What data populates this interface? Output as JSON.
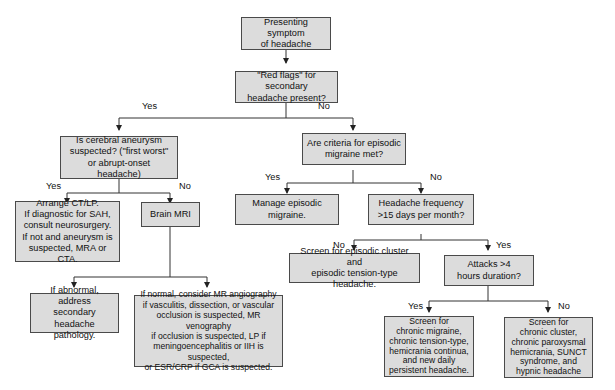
{
  "diagram": {
    "type": "flowchart",
    "colors": {
      "box_fill": "#dcdcdc",
      "box_border": "#4a4a4a",
      "line": "#333333",
      "background": "#ffffff"
    },
    "nodes": {
      "start": "Presenting symptom\nof headache",
      "red_flags": "\"Red flags\" for secondary\nheadache present?",
      "aneurysm": "Is cerebral aneurysm\nsuspected? (\"first worst\"\nor abrupt-onset headache)",
      "episodic_criteria": "Are criteria for episodic\nmigraine met?",
      "ct_lp": "Arrange CT/LP.\nIf diagnostic for SAH,\nconsult neurosurgery.\nIf not and aneurysm is\nsuspected, MRA or CTA.",
      "brain_mri": "Brain MRI",
      "manage_episodic": "Manage episodic\nmigraine.",
      "frequency": "Headache frequency\n>15 days per month?",
      "abnormal": "If abnormal, address\nsecondary headache\npathology.",
      "normal": "If normal, consider MR angiography\nif vasculitis, dissection, or vascular\nocclusion is suspected, MR venography\nif occlusion is suspected, LP if\nmeningoencephalitis or IIH is suspected,\nor ESR/CRP if GCA is suspected.",
      "screen_episodic": "Screen for episodic cluster and\nepisodic tension-type headache.",
      "attacks": "Attacks >4\nhours duration?",
      "screen_chronic_migraine": "Screen for\nchronic migraine,\nchronic tension-type,\nhemicrania continua,\nand new daily\npersistent headache.",
      "screen_chronic_cluster": "Screen for\nchronic cluster,\nchronic paroxysmal\nhemicrania, SUNCT\nsyndrome, and\nhypnic headache"
    },
    "edge_labels": {
      "red_flags_yes": "Yes",
      "red_flags_no": "No",
      "aneurysm_yes": "Yes",
      "aneurysm_no": "No",
      "episodic_yes": "Yes",
      "episodic_no": "No",
      "frequency_no": "No",
      "frequency_yes": "Yes",
      "attacks_yes": "Yes",
      "attacks_no": "No"
    },
    "edges": [
      {
        "from": "start",
        "to": "red_flags",
        "label": ""
      },
      {
        "from": "red_flags",
        "to": "aneurysm",
        "label": "Yes"
      },
      {
        "from": "red_flags",
        "to": "episodic_criteria",
        "label": "No"
      },
      {
        "from": "aneurysm",
        "to": "ct_lp",
        "label": "Yes"
      },
      {
        "from": "aneurysm",
        "to": "brain_mri",
        "label": "No"
      },
      {
        "from": "brain_mri",
        "to": "abnormal",
        "label": ""
      },
      {
        "from": "brain_mri",
        "to": "normal",
        "label": ""
      },
      {
        "from": "episodic_criteria",
        "to": "manage_episodic",
        "label": "Yes"
      },
      {
        "from": "episodic_criteria",
        "to": "frequency",
        "label": "No"
      },
      {
        "from": "frequency",
        "to": "screen_episodic",
        "label": "No"
      },
      {
        "from": "frequency",
        "to": "attacks",
        "label": "Yes"
      },
      {
        "from": "attacks",
        "to": "screen_chronic_migraine",
        "label": "Yes"
      },
      {
        "from": "attacks",
        "to": "screen_chronic_cluster",
        "label": "No"
      }
    ]
  }
}
